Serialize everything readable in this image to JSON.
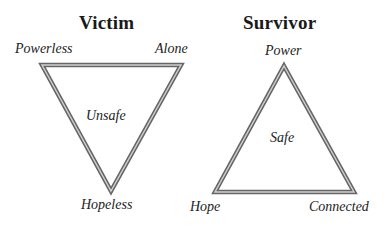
{
  "victim": {
    "title": "Victim",
    "corners": {
      "top_left": "Powerless",
      "top_right": "Alone",
      "bottom": "Hopeless"
    },
    "center": "Unsafe"
  },
  "survivor": {
    "title": "Survivor",
    "corners": {
      "top": "Power",
      "bottom_left": "Hope",
      "bottom_right": "Connected"
    },
    "center": "Safe"
  },
  "colors": {
    "outline_outer": "#666666",
    "outline_inner": "#bdbdbd",
    "text": "#1a1a1a"
  }
}
